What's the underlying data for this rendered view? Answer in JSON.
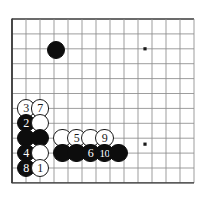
{
  "diagram": {
    "type": "go-board-diagram",
    "board": {
      "grid_cols": 14,
      "grid_rows": 12,
      "origin_x": 12,
      "origin_y": 19,
      "step_x": 14,
      "step_y": 14.9,
      "line_color": "#8c8c8c",
      "edge_color": "#3a3a3a",
      "background": "#ffffff",
      "star_points": [
        {
          "col": 9.5,
          "row": 2
        },
        {
          "col": 9.5,
          "row": 8.4
        }
      ]
    },
    "stones": [
      {
        "id": "stone-unnumbered-a",
        "color": "black",
        "label": "",
        "col": 3.15,
        "row": 2.08
      },
      {
        "id": "stone-3",
        "color": "white",
        "label": "3",
        "col": 1.0,
        "row": 6.0
      },
      {
        "id": "stone-7",
        "color": "white",
        "label": "7",
        "col": 2.0,
        "row": 6.0
      },
      {
        "id": "stone-2",
        "color": "black",
        "label": "2",
        "col": 1.0,
        "row": 7.0
      },
      {
        "id": "stone-unnumbered-b",
        "color": "white",
        "label": "",
        "col": 2.0,
        "row": 7.0
      },
      {
        "id": "stone-unnumbered-c",
        "color": "black",
        "label": "",
        "col": 1.0,
        "row": 8.0
      },
      {
        "id": "stone-unnumbered-d",
        "color": "black",
        "label": "",
        "col": 2.0,
        "row": 8.0
      },
      {
        "id": "stone-unnumbered-e",
        "color": "white",
        "label": "",
        "col": 3.6,
        "row": 8.0
      },
      {
        "id": "stone-5",
        "color": "white",
        "label": "5",
        "col": 4.6,
        "row": 8.0
      },
      {
        "id": "stone-unnumbered-f",
        "color": "white",
        "label": "",
        "col": 5.6,
        "row": 8.0
      },
      {
        "id": "stone-9",
        "color": "white",
        "label": "9",
        "col": 6.6,
        "row": 8.0
      },
      {
        "id": "stone-4",
        "color": "black",
        "label": "4",
        "col": 1.0,
        "row": 9.0
      },
      {
        "id": "stone-unnumbered-g",
        "color": "white",
        "label": "",
        "col": 2.0,
        "row": 9.0
      },
      {
        "id": "stone-unnumbered-h",
        "color": "black",
        "label": "",
        "col": 3.6,
        "row": 9.0
      },
      {
        "id": "stone-unnumbered-i",
        "color": "black",
        "label": "",
        "col": 4.6,
        "row": 9.0
      },
      {
        "id": "stone-6",
        "color": "black",
        "label": "6",
        "col": 5.6,
        "row": 9.0
      },
      {
        "id": "stone-10",
        "color": "black",
        "label": "10",
        "col": 6.6,
        "row": 9.0
      },
      {
        "id": "stone-unnumbered-j",
        "color": "black",
        "label": "",
        "col": 7.6,
        "row": 9.0
      },
      {
        "id": "stone-8",
        "color": "black",
        "label": "8",
        "col": 1.0,
        "row": 10.0
      },
      {
        "id": "stone-1",
        "color": "white",
        "label": "1",
        "col": 2.0,
        "row": 10.0
      }
    ],
    "stone_radius": 9.2
  }
}
